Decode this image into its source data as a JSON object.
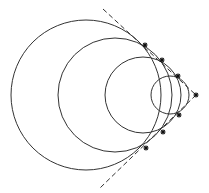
{
  "diagram": {
    "type": "nested circles tangent to two lines meeting at an apex",
    "background": "#ffffff",
    "stroke_color": "#333333",
    "apex": {
      "x": 196,
      "y": 95
    },
    "circles": [
      {
        "cx": 86,
        "cy": 95,
        "r": 75
      },
      {
        "cx": 115,
        "cy": 95,
        "r": 57
      },
      {
        "cx": 143,
        "cy": 95,
        "r": 38
      },
      {
        "cx": 170,
        "cy": 95,
        "r": 19
      }
    ],
    "tangent_lines": [
      {
        "x1": 103,
        "y1": 9,
        "x2": 196,
        "y2": 95,
        "style": "dashed"
      },
      {
        "x1": 196,
        "y1": 95,
        "x2": 100,
        "y2": 188,
        "style": "dashed"
      }
    ],
    "marked_points": [
      {
        "x": 145,
        "y": 45
      },
      {
        "x": 162,
        "y": 60
      },
      {
        "x": 178,
        "y": 76
      },
      {
        "x": 179,
        "y": 115
      },
      {
        "x": 163,
        "y": 132
      },
      {
        "x": 146,
        "y": 148
      },
      {
        "x": 196,
        "y": 95
      }
    ]
  }
}
